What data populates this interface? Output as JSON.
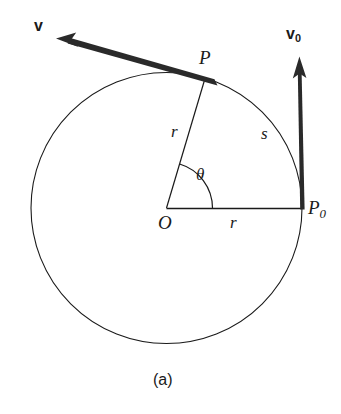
{
  "figure": {
    "caption": "(a)",
    "background_color": "#ffffff",
    "stroke_color": "#1a1a1a",
    "thin_stroke_width": 1.1,
    "thick_stroke_width": 5
  },
  "labels": {
    "v": "v",
    "v0_base": "v",
    "v0_sub": "0",
    "P": "P",
    "P0_base": "P",
    "P0_sub": "0",
    "O": "O",
    "r_radius_OP": "r",
    "r_radius_OP0": "r",
    "s_arc": "s",
    "theta": "θ"
  },
  "geometry": {
    "circle": {
      "cx": 166.5,
      "cy": 208,
      "r": 135.5
    },
    "center_point": {
      "name": "O",
      "x": 166.5,
      "y": 208
    },
    "point_P": {
      "name": "P",
      "x": 205,
      "y": 78.5
    },
    "point_P0": {
      "name": "P0",
      "x": 302,
      "y": 208
    },
    "theta_arc": {
      "radius": 46,
      "start_deg": 0,
      "end_deg": 73.6
    },
    "arc_s": {
      "from": "P",
      "to": "P0",
      "radius": 135.5
    },
    "vector_v": {
      "from_x": 216,
      "from_y": 83,
      "to_x": 57,
      "to_y": 38,
      "label": "v"
    },
    "vector_v0": {
      "from_x": 303,
      "from_y": 209,
      "to_x": 299,
      "to_y": 57,
      "label": "v0"
    }
  },
  "label_positions": {
    "v": {
      "x": 34,
      "y": 18
    },
    "v0": {
      "x": 286,
      "y": 26
    },
    "P": {
      "x": 199,
      "y": 48
    },
    "P0": {
      "x": 308,
      "y": 198
    },
    "O": {
      "x": 158,
      "y": 213
    },
    "r_up": {
      "x": 171,
      "y": 123
    },
    "r_low": {
      "x": 230,
      "y": 214
    },
    "s": {
      "x": 261,
      "y": 125
    },
    "theta": {
      "x": 196,
      "y": 166
    },
    "caption": {
      "x": 153,
      "y": 372
    }
  }
}
